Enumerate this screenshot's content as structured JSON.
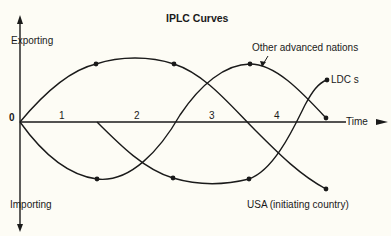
{
  "title": "IPLC Curves",
  "axes": {
    "y_top_label": "Exporting",
    "y_bottom_label": "Importing",
    "origin_label": "0",
    "x_label": "Time"
  },
  "periods": [
    "1",
    "2",
    "3",
    "4"
  ],
  "curves": [
    {
      "name": "USA (initiating country)",
      "label": "USA (initiating country)"
    },
    {
      "name": "Other advanced nations",
      "label": "Other advanced nations"
    },
    {
      "name": "LDCs",
      "label": "LDC s"
    }
  ],
  "colors": {
    "line": "#1a1a1a",
    "background": "#fdfcf5"
  }
}
